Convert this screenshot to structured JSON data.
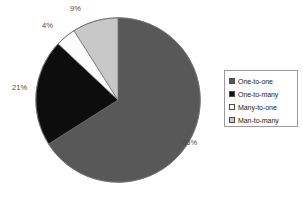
{
  "chart_data": {
    "type": "pie",
    "title": "",
    "subtitle": "",
    "xlabel": "",
    "ylabel": "",
    "grid": false,
    "legend_position": "right",
    "start_angle_deg": 90,
    "direction": "clockwise",
    "categories": [
      "One-to-one",
      "One-to-many",
      "Many-to-one",
      "Man-to-many"
    ],
    "values": [
      66,
      21,
      4,
      9
    ],
    "value_unit": "%",
    "data_labels": [
      "66%",
      "21%",
      "4%",
      "9%"
    ],
    "colors": [
      "#585858",
      "#0d0d0d",
      "#fbfbfb",
      "#c8c8c8"
    ],
    "slices": [
      {
        "label": "One-to-one",
        "value": 66,
        "data_label": "66%",
        "color": "#585858"
      },
      {
        "label": "One-to-many",
        "value": 21,
        "data_label": "21%",
        "color": "#0d0d0d"
      },
      {
        "label": "Many-to-one",
        "value": 4,
        "data_label": "4%",
        "color": "#fbfbfb"
      },
      {
        "label": "Man-to-many",
        "value": 9,
        "data_label": "9%",
        "color": "#c8c8c8"
      }
    ]
  },
  "legend": {
    "items": [
      {
        "label": "One-to-one",
        "swatch_name": "legend-swatch-one-to-one",
        "color": "#585858"
      },
      {
        "label": "One-to-many",
        "swatch_name": "legend-swatch-one-to-many",
        "color": "#0d0d0d"
      },
      {
        "label": "Many-to-one",
        "swatch_name": "legend-swatch-many-to-one",
        "color": "#fbfbfb"
      },
      {
        "label": "Man-to-many",
        "swatch_name": "legend-swatch-man-to-many",
        "color": "#c8c8c8"
      }
    ]
  }
}
